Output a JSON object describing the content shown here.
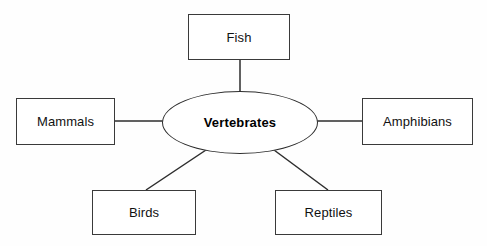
{
  "diagram": {
    "type": "concept-map-spider",
    "background_color": "#fefefe",
    "line_color": "#2d2d2d",
    "border_color": "#3a3a3a",
    "text_color": "#111111",
    "center": {
      "label": "Vertebrates",
      "shape": "ellipse",
      "bold": true,
      "cx": 240,
      "cy": 122.5,
      "rx": 78,
      "ry": 31.5
    },
    "nodes": [
      {
        "id": "fish",
        "label": "Fish",
        "shape": "rectangle",
        "position": "top",
        "x": 188,
        "y": 14,
        "width": 102,
        "height": 46
      },
      {
        "id": "mammals",
        "label": "Mammals",
        "shape": "rectangle",
        "position": "left",
        "x": 16,
        "y": 98,
        "width": 99,
        "height": 47
      },
      {
        "id": "amphibians",
        "label": "Amphibians",
        "shape": "rectangle",
        "position": "right",
        "x": 362,
        "y": 98,
        "width": 111,
        "height": 47
      },
      {
        "id": "birds",
        "label": "Birds",
        "shape": "rectangle",
        "position": "bottom-left",
        "x": 92,
        "y": 190,
        "width": 104,
        "height": 45
      },
      {
        "id": "reptiles",
        "label": "Reptiles",
        "shape": "rectangle",
        "position": "bottom-right",
        "x": 275,
        "y": 190,
        "width": 107,
        "height": 45
      }
    ],
    "connectors": [
      {
        "id": "center-to-fish",
        "from": "center",
        "to": "fish",
        "x1": 240,
        "y1": 91,
        "x2": 240,
        "y2": 60,
        "orientation": "vertical"
      },
      {
        "id": "center-to-mammals",
        "from": "center",
        "to": "mammals",
        "x1": 163,
        "y1": 121,
        "x2": 115,
        "y2": 121,
        "orientation": "horizontal"
      },
      {
        "id": "center-to-amphibians",
        "from": "center",
        "to": "amphibians",
        "x1": 317,
        "y1": 121,
        "x2": 362,
        "y2": 121,
        "orientation": "horizontal"
      },
      {
        "id": "center-to-birds",
        "from": "center",
        "to": "birds",
        "x1": 205,
        "y1": 151,
        "x2": 146,
        "y2": 190,
        "orientation": "diagonal"
      },
      {
        "id": "center-to-reptiles",
        "from": "center",
        "to": "reptiles",
        "x1": 274,
        "y1": 151,
        "x2": 328,
        "y2": 190,
        "orientation": "diagonal"
      }
    ]
  }
}
